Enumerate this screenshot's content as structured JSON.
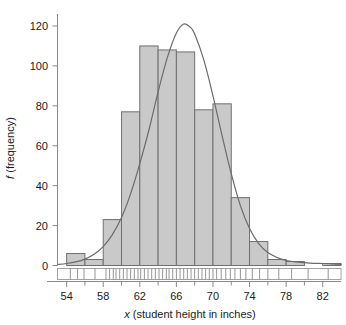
{
  "chart_data": {
    "type": "bar",
    "title": "",
    "subtitle": "",
    "xlabel_italic": "x",
    "xlabel_rest": " (student height in inches)",
    "xlabel": "x (student height in inches)",
    "ylabel_italic": "f",
    "ylabel_rest": " (frequency)",
    "ylabel": "f (frequency)",
    "grid": false,
    "legend": false,
    "legend_position": "none",
    "xlim": [
      53,
      84
    ],
    "ylim": [
      0,
      125
    ],
    "bin_width": 2,
    "xticks": [
      54,
      58,
      62,
      66,
      70,
      74,
      78,
      82
    ],
    "xtick_labels": [
      "54",
      "58",
      "62",
      "66",
      "70",
      "74",
      "78",
      "82"
    ],
    "xminor_ticks": [
      56,
      60,
      64,
      68,
      72,
      76,
      80
    ],
    "yticks": [
      0,
      20,
      40,
      60,
      80,
      100,
      120
    ],
    "ytick_labels": [
      "0",
      "20",
      "40",
      "60",
      "80",
      "100",
      "120"
    ],
    "categories": [
      "54-56",
      "56-58",
      "58-60",
      "60-62",
      "62-64",
      "64-66",
      "66-68",
      "68-70",
      "70-72",
      "72-74",
      "74-76",
      "76-78",
      "78-80",
      "80-82",
      "82-84"
    ],
    "bin_edges": [
      54,
      56,
      58,
      60,
      62,
      64,
      66,
      68,
      70,
      72,
      74,
      76,
      78,
      80,
      82,
      84
    ],
    "values": [
      6,
      3,
      23,
      77,
      110,
      108,
      107,
      78,
      81,
      34,
      12,
      3,
      2,
      0,
      1
    ],
    "series": [
      {
        "name": "frequency",
        "type": "bar",
        "values": [
          6,
          3,
          23,
          77,
          110,
          108,
          107,
          78,
          81,
          34,
          12,
          3,
          2,
          0,
          1
        ]
      },
      {
        "name": "normal curve",
        "type": "line",
        "peak_x": 66.8,
        "peak_y": 121,
        "mean": 66.8,
        "std_dev": 3.3,
        "x": [
          53.0,
          54.0,
          55.0,
          56.0,
          57.0,
          58.0,
          59.0,
          60.0,
          61.0,
          62.0,
          63.0,
          64.0,
          65.0,
          66.0,
          66.8,
          67.5,
          68.0,
          69.0,
          70.0,
          71.0,
          72.0,
          73.0,
          74.0,
          75.0,
          76.0,
          77.0,
          78.0,
          79.0,
          80.0,
          81.0,
          82.0,
          83.0,
          84.0
        ],
        "y": [
          0.5,
          1.0,
          1.8,
          3.2,
          5.6,
          9.5,
          15.5,
          24.0,
          36.0,
          51.0,
          68.0,
          87.0,
          104.0,
          116.5,
          121.0,
          119.5,
          116.0,
          103.0,
          85.0,
          65.0,
          46.0,
          30.0,
          18.5,
          11.0,
          6.5,
          4.0,
          2.5,
          1.8,
          1.4,
          1.1,
          1.0,
          0.8,
          0.6
        ]
      }
    ],
    "rug_plot": {
      "present": true,
      "description": "strip of individual observation tick marks below the baseline",
      "marks": [
        54.4,
        55.2,
        55.9,
        57.1,
        58.3,
        58.7,
        59.1,
        59.4,
        59.8,
        60.2,
        60.6,
        61.0,
        61.4,
        61.8,
        62.1,
        62.5,
        62.9,
        63.3,
        63.7,
        64.1,
        64.5,
        64.9,
        65.2,
        65.6,
        66.0,
        66.4,
        66.8,
        67.2,
        67.6,
        68.0,
        68.4,
        68.8,
        69.2,
        69.6,
        70.0,
        70.4,
        70.9,
        71.4,
        71.9,
        72.4,
        73.0,
        73.6,
        74.3,
        75.1,
        76.0,
        77.2,
        78.6,
        80.4,
        82.6
      ]
    },
    "colors": {
      "bar_fill": "#c9c9c9",
      "bar_edge": "#707070",
      "curve": "#6b6b6b",
      "axis": "#8a8a8a",
      "text": "#1a1a1a"
    }
  }
}
